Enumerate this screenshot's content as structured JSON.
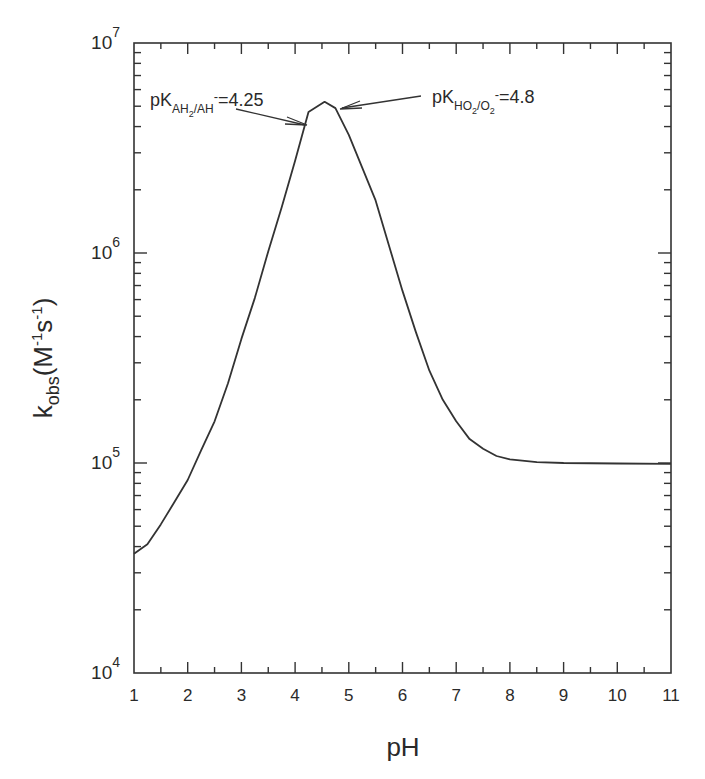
{
  "chart_data": {
    "type": "line",
    "title": "",
    "xlabel": "pH",
    "ylabel": "k_obs(M^-1 s^-1)",
    "ylabel_parts": {
      "main": "k",
      "sub": "obs",
      "rest1": "(M",
      "sup1": "-1",
      "rest2": "s",
      "sup2": "-1",
      "rest3": ")"
    },
    "xlim": [
      1,
      11
    ],
    "ylim": [
      10000,
      10000000
    ],
    "yscale": "log",
    "grid": false,
    "x_ticks": [
      "1",
      "2",
      "3",
      "4",
      "5",
      "6",
      "7",
      "8",
      "9",
      "10",
      "11"
    ],
    "y_ticks": [
      {
        "base": "10",
        "exp": "4",
        "value": 10000
      },
      {
        "base": "10",
        "exp": "5",
        "value": 100000
      },
      {
        "base": "10",
        "exp": "6",
        "value": 1000000
      },
      {
        "base": "10",
        "exp": "7",
        "value": 10000000
      }
    ],
    "series": [
      {
        "name": "k_obs",
        "x": [
          1.0,
          1.25,
          1.5,
          1.75,
          2.0,
          2.25,
          2.5,
          2.75,
          3.0,
          3.25,
          3.5,
          3.75,
          4.0,
          4.25,
          4.55,
          4.75,
          5.0,
          5.25,
          5.5,
          5.75,
          6.0,
          6.25,
          6.5,
          6.75,
          7.0,
          7.25,
          7.5,
          7.75,
          8.0,
          8.5,
          9.0,
          10.0,
          11.0
        ],
        "y": [
          37000,
          41000,
          51000,
          65000,
          83000,
          115000,
          158000,
          240000,
          390000,
          610000,
          1020000,
          1650000,
          2750000,
          4700000,
          5250000,
          4900000,
          3650000,
          2550000,
          1780000,
          1080000,
          660000,
          420000,
          275000,
          200000,
          158000,
          130000,
          117000,
          108000,
          104000,
          101000,
          100000,
          99500,
          99000
        ]
      }
    ],
    "annotations": [
      {
        "text_main": "pK",
        "text_sub": "AH2/AH",
        "text_sup": "-",
        "text_tail": "=4.25",
        "label": "pK_AH2/AH- = 4.25",
        "arrow_to_pH": 4.25
      },
      {
        "text_main": "pK",
        "text_sub": "HO2/O2",
        "text_sup": "-",
        "text_tail": "=4.8",
        "label": "pK_HO2/O2- = 4.8",
        "arrow_to_pH": 4.8
      }
    ],
    "legend": null
  },
  "labels": {
    "x_title": "pH",
    "y_title_k": "k",
    "y_title_obs": "obs",
    "y_title_M": "(M",
    "y_title_sup1": "-1",
    "y_title_s": "s",
    "y_title_sup2": "-1",
    "y_title_close": ")",
    "ann1_pk": "pK",
    "ann1_sub_a": "AH",
    "ann1_sub_2": "2",
    "ann1_sub_b": "/AH",
    "ann1_sup": "-",
    "ann1_val": "=4.25",
    "ann2_pk": "pK",
    "ann2_sub_a": "HO",
    "ann2_sub_2a": "2",
    "ann2_sub_b": "/O",
    "ann2_sub_2b": "2",
    "ann2_sup": "-",
    "ann2_val": "=4.8"
  }
}
